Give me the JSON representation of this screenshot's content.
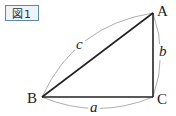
{
  "figure_label": "図1",
  "vertices": {
    "A": "A",
    "B": "B",
    "C": "C"
  },
  "sides": {
    "a": "a",
    "b": "b",
    "c": "c"
  },
  "colors": {
    "box_border": "#5a86c0",
    "box_fill": "#eef3fa",
    "lines": "#222222",
    "arcs": "#999999"
  }
}
